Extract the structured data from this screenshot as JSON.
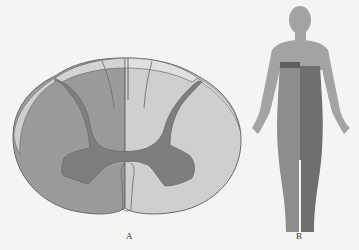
{
  "figure": {
    "panels": [
      {
        "id": "A",
        "label": "A",
        "description": "Cross-section of spinal cord with left half shaded (hemisection)",
        "colors": {
          "affected_white_matter": "#9a9a98",
          "unaffected_white_matter": "#cfcfcd",
          "grey_matter": "#7e7e7c",
          "outer_rim_light": "#d9d9d7",
          "outline": "#6a6a68"
        }
      },
      {
        "id": "B",
        "label": "B",
        "description": "Human body figure showing ipsilateral and contralateral sensory loss below a level",
        "colors": {
          "body": "#a3a3a1",
          "left_side_below_level": "#8d8d8b",
          "right_side_below_level": "#6f6f6d",
          "band": "#5e5e5c"
        }
      }
    ],
    "background": "#f4f4f2"
  }
}
